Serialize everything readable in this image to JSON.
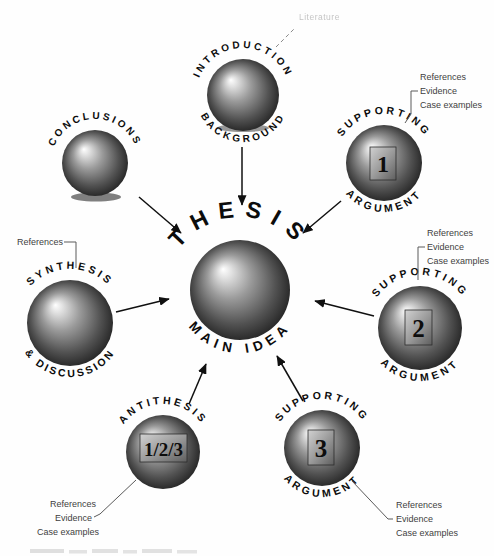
{
  "diagram": {
    "center": {
      "top": "THESIS",
      "bottom": "MAIN IDEA"
    },
    "nodes": {
      "introduction": {
        "top": "INTRODUCTION",
        "bottom": "BACKGROUND",
        "note": "Literature"
      },
      "conclusions": {
        "top": "CONCLUSIONS"
      },
      "supporting_argument_1": {
        "top": "SUPPORTING",
        "bottom": "ARGUMENT",
        "badge": "1"
      },
      "synthesis": {
        "top": "SYNTHESIS",
        "bottom": "& DISCUSSION",
        "note": "References"
      },
      "supporting_argument_2": {
        "top": "SUPPORTING",
        "bottom": "ARGUMENT",
        "badge": "2"
      },
      "antithesis": {
        "top": "ANTITHESIS",
        "badge": "1/2/3"
      },
      "supporting_argument_3": {
        "top": "SUPPORTING",
        "bottom": "ARGUMENT",
        "badge": "3"
      }
    },
    "annotation_blocks": {
      "supporting_argument_1": [
        "References",
        "Evidence",
        "Case examples"
      ],
      "supporting_argument_2": [
        "References",
        "Evidence",
        "Case examples"
      ],
      "antithesis": [
        "References",
        "Evidence",
        "Case examples"
      ],
      "supporting_argument_3": [
        "References",
        "Evidence",
        "Case examples"
      ]
    },
    "colors": {
      "ink": "#101010",
      "annotation_text": "#3f3f3f",
      "sphere_highlight": "#ffffff",
      "sphere_shadow": "#161616",
      "badge_face_light": "#d2d2d2",
      "badge_face_dark": "#5e5e5e"
    }
  }
}
